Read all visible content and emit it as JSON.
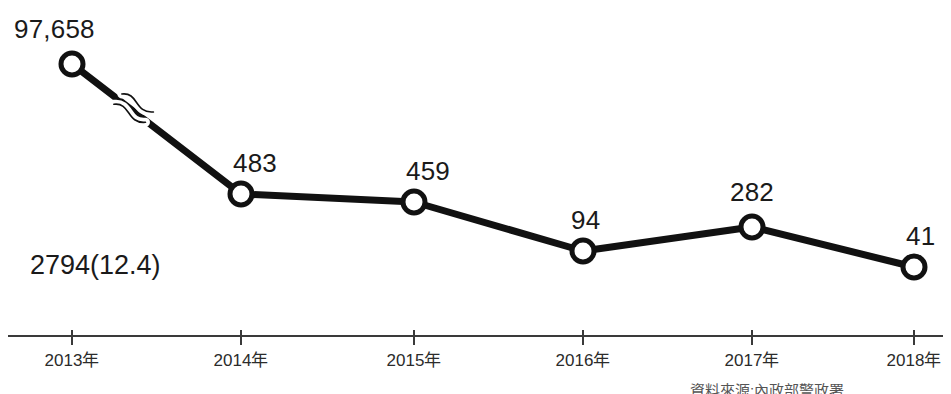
{
  "chart_data": {
    "type": "line",
    "title": "",
    "subtitle": "",
    "xlabel": "",
    "ylabel": "",
    "categories": [
      "2013年",
      "2014年",
      "2015年",
      "2016年",
      "2017年",
      "2018年"
    ],
    "values": [
      97658,
      483,
      459,
      94,
      282,
      41
    ],
    "point_labels": [
      "97,658",
      "483",
      "459",
      "94",
      "282",
      "41"
    ],
    "series": [
      {
        "name": "",
        "values": [
          97658,
          483,
          459,
          94,
          282,
          41
        ],
        "marker": "open-circle",
        "color": "#111111"
      }
    ],
    "pixel_points": [
      {
        "x": 72,
        "y": 64,
        "label": "97,658"
      },
      {
        "x": 241,
        "y": 194,
        "label": "483"
      },
      {
        "x": 414,
        "y": 202,
        "label": "459"
      },
      {
        "x": 583,
        "y": 251,
        "label": "94"
      },
      {
        "x": 752,
        "y": 227,
        "label": "282"
      },
      {
        "x": 914,
        "y": 267,
        "label": "41"
      }
    ],
    "label_offsets": [
      {
        "dx": -58,
        "dy": -48
      },
      {
        "dx": -8,
        "dy": -44
      },
      {
        "dx": -8,
        "dy": -44
      },
      {
        "dx": -12,
        "dy": -44
      },
      {
        "dx": -22,
        "dy": -48
      },
      {
        "dx": -8,
        "dy": -44
      }
    ],
    "axis_break": {
      "present": true,
      "style": "double-wave",
      "x": 140,
      "y": 113,
      "note": "scale break on first segment between 2013 and 2014"
    },
    "annotations": [
      "2794(12.4)"
    ],
    "grid": false,
    "legend": false,
    "y_axis_visible": false,
    "x_axis_visible": true
  },
  "annotation": {
    "value_note": "2794(12.4)"
  },
  "axis": {
    "line_color": "#3a3a3a",
    "tick_color": "#3a3a3a",
    "baseline_y": 336
  },
  "colors": {
    "line": "#111111",
    "marker_fill": "#ffffff",
    "marker_stroke": "#111111",
    "text": "#1a1a1a",
    "axis": "#3a3a3a",
    "background": "#ffffff"
  },
  "source_note": {
    "text": "資料來源:內政部警政署"
  }
}
